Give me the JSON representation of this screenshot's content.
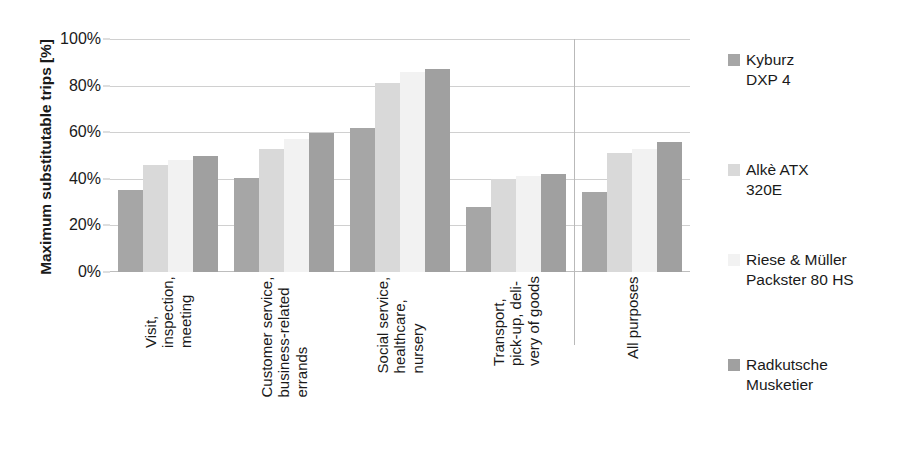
{
  "chart_data": {
    "type": "bar",
    "title": "",
    "xlabel": "",
    "ylabel": "Maximum substitutable trips [%]",
    "ylim": [
      0,
      100
    ],
    "ytick_values": [
      0,
      20,
      40,
      60,
      80,
      100
    ],
    "ytick_labels": [
      "0%",
      "20%",
      "40%",
      "60%",
      "80%",
      "100%"
    ],
    "grid": true,
    "legend_position": "right",
    "categories": [
      "Visit,\ninspection,\nmeeting",
      "Customer service,\nbusiness-related\nerrands",
      "Social service,\nhealthcare,\nnursery",
      "Transport,\npick-up, deli-\nvery of goods",
      "All purposes"
    ],
    "category_lines": [
      [
        "Visit,",
        "inspection,",
        "meeting"
      ],
      [
        "Customer service,",
        "business-related",
        "errands"
      ],
      [
        "Social service,",
        "healthcare,",
        "nursery"
      ],
      [
        "Transport,",
        "pick-up, deli-",
        "very of goods"
      ],
      [
        "All purposes"
      ]
    ],
    "series": [
      {
        "name": "Kyburz\nDXP 4",
        "color": "#a6a6a6",
        "values": [
          35,
          40.5,
          62,
          28,
          34.5
        ]
      },
      {
        "name": "Alkè ATX\n320E",
        "color": "#d9d9d9",
        "values": [
          46,
          53,
          81,
          40,
          51
        ]
      },
      {
        "name": "Riese & Müller\nPackster 80 HS",
        "color": "#f2f2f2",
        "values": [
          48,
          57,
          86,
          41,
          53
        ]
      },
      {
        "name": "Radkutsche\nMusketier",
        "color": "#a0a0a0",
        "values": [
          50,
          59.5,
          87,
          42,
          56
        ]
      }
    ]
  },
  "legend": {
    "items": [
      {
        "label": "Kyburz\nDXP 4",
        "color": "#a6a6a6"
      },
      {
        "label": "Alkè ATX\n320E",
        "color": "#d9d9d9"
      },
      {
        "label": "Riese & Müller\nPackster 80 HS",
        "color": "#f2f2f2"
      },
      {
        "label": "Radkutsche\nMusketier",
        "color": "#a0a0a0"
      }
    ]
  }
}
